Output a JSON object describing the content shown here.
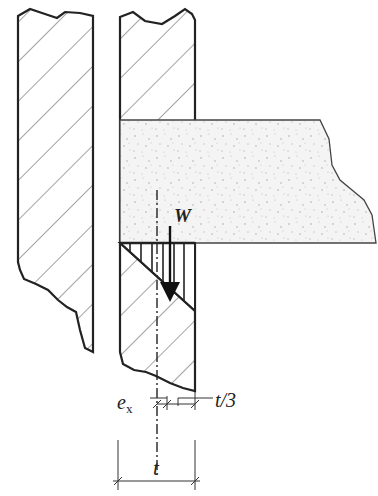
{
  "diagram": {
    "labels": {
      "load": "W",
      "eccentricity": "e",
      "eccentricity_sub": "x",
      "third": "t/3",
      "thickness": "t"
    },
    "elements": [
      {
        "id": "left-wall",
        "type": "hatched-masonry-section"
      },
      {
        "id": "right-wall",
        "type": "hatched-masonry-section"
      },
      {
        "id": "concrete-slab",
        "type": "speckled-concrete-section"
      },
      {
        "id": "stress-block",
        "type": "triangular-bearing-pressure"
      },
      {
        "id": "load-arrow",
        "type": "resultant-force"
      },
      {
        "id": "centerline",
        "type": "dash-dot-axis"
      }
    ],
    "colors": {
      "line": "#222222",
      "hatch": "#555555",
      "concrete_fill": "#f3f3f3",
      "speckle": "#c8c8c8"
    }
  }
}
